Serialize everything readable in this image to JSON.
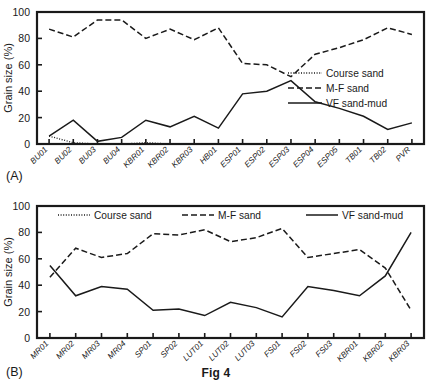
{
  "figure": {
    "caption": "Fig 4"
  },
  "panels": [
    {
      "tag": "(A)",
      "ylabel": "Grain size (%)",
      "yticks": [
        "0",
        "20",
        "40",
        "60",
        "80",
        "100"
      ],
      "legend_position": "inside-right"
    },
    {
      "tag": "(B)",
      "ylabel": "Grain size (%)",
      "yticks": [
        "0",
        "20",
        "40",
        "60",
        "80",
        "100"
      ],
      "legend_position": "inside-top"
    }
  ],
  "legend": {
    "course_sand": "Course sand",
    "mf_sand": "M-F sand",
    "vf_sand_mud": "VF sand-mud"
  },
  "chart_data": [
    {
      "type": "line",
      "title": "(A)",
      "xlabel": "",
      "ylabel": "Grain size (%)",
      "ylim": [
        0,
        100
      ],
      "yticks": [
        0,
        20,
        40,
        60,
        80,
        100
      ],
      "grid": false,
      "legend": "inside right",
      "categories": [
        "BU01",
        "BU02",
        "BU03",
        "BU04",
        "KBR01",
        "KBR02",
        "KBR03",
        "HB01",
        "ESP01",
        "ESP02",
        "ESP03",
        "ESP04",
        "ESP05",
        "TB01",
        "TB02",
        "PVR"
      ],
      "series": [
        {
          "name": "Course sand",
          "style": "dotted",
          "values": [
            6,
            1,
            0,
            0,
            1,
            0,
            0,
            0,
            0,
            0,
            0,
            0,
            0,
            0,
            0,
            0
          ]
        },
        {
          "name": "M-F sand",
          "style": "dashed",
          "values": [
            87,
            81,
            94,
            94,
            80,
            87,
            79,
            88,
            61,
            60,
            51,
            68,
            73,
            79,
            88,
            83
          ]
        },
        {
          "name": "VF sand-mud",
          "style": "solid",
          "values": [
            6,
            18,
            2,
            5,
            18,
            13,
            21,
            12,
            38,
            40,
            48,
            32,
            27,
            21,
            11,
            16
          ]
        }
      ]
    },
    {
      "type": "line",
      "title": "(B)",
      "xlabel": "",
      "ylabel": "Grain size (%)",
      "ylim": [
        0,
        100
      ],
      "yticks": [
        0,
        20,
        40,
        60,
        80,
        100
      ],
      "grid": false,
      "legend": "inside top",
      "categories": [
        "MR01",
        "MR02",
        "MR03",
        "MR04",
        "SP01",
        "SP02",
        "LUT01",
        "LUT02",
        "LUT03",
        "FS01",
        "FS02",
        "FS03",
        "KBR01",
        "KBR02",
        "KBR03"
      ],
      "series": [
        {
          "name": "Course sand",
          "style": "dotted",
          "values": [
            0,
            0,
            0,
            0,
            0,
            0,
            0,
            0,
            0,
            0,
            0,
            0,
            0,
            0,
            0
          ]
        },
        {
          "name": "M-F sand",
          "style": "dashed",
          "values": [
            46,
            68,
            61,
            64,
            79,
            78,
            82,
            73,
            76,
            83,
            61,
            64,
            67,
            53,
            21
          ]
        },
        {
          "name": "VF sand-mud",
          "style": "solid",
          "values": [
            55,
            32,
            39,
            37,
            21,
            22,
            17,
            27,
            23,
            16,
            39,
            36,
            32,
            47,
            80
          ]
        }
      ]
    }
  ]
}
